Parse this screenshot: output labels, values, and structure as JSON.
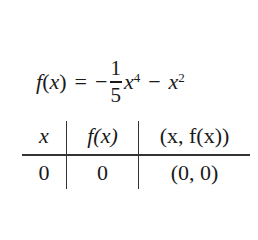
{
  "equation": {
    "lhs_func": "f",
    "lhs_open": "(",
    "lhs_var": "x",
    "lhs_close": ")",
    "equals": "=",
    "minus1": "−",
    "frac_num": "1",
    "frac_den": "5",
    "term1_var": "x",
    "term1_exp": "4",
    "minus2": "−",
    "term2_var": "x",
    "term2_exp": "2"
  },
  "table": {
    "headers": [
      "x",
      "f(x)",
      "(x, f(x))"
    ],
    "rows": [
      [
        "0",
        "0",
        "(0, 0)"
      ]
    ]
  }
}
